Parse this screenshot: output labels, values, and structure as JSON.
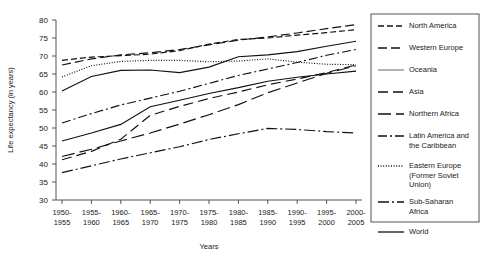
{
  "chart_data": {
    "type": "line",
    "title": "",
    "xlabel": "Years",
    "ylabel": "Life expectancy (in years)",
    "ylim": [
      30,
      80
    ],
    "ytick_step": 5,
    "yticks": [
      30,
      35,
      40,
      45,
      50,
      55,
      60,
      65,
      70,
      75,
      80
    ],
    "grid": false,
    "legend_position": "right",
    "categories": [
      "1950-\n1955",
      "1955-\n1960",
      "1960-\n1965",
      "1965-\n1970",
      "1970-\n1975",
      "1975-\n1980",
      "1980-\n1985",
      "1985-\n1990",
      "1990-\n1995",
      "1995-\n2000",
      "2000-\n2005"
    ],
    "categories_flat": [
      "1950-1955",
      "1955-1960",
      "1960-1965",
      "1965-1970",
      "1970-1975",
      "1975-1980",
      "1980-1985",
      "1985-1990",
      "1990-1995",
      "1995-2000",
      "2000-2005"
    ],
    "series": [
      {
        "name": "North America",
        "style": "dotted-dash",
        "dasharray": "6,3",
        "color": "#111111",
        "values": [
          68.8,
          69.7,
          70.1,
          70.5,
          71.5,
          73.3,
          74.6,
          75.0,
          75.8,
          76.5,
          77.3
        ]
      },
      {
        "name": "Western Europe",
        "style": "dashed-long",
        "dasharray": "9,4",
        "color": "#111111",
        "values": [
          67.5,
          69.2,
          70.3,
          70.9,
          71.8,
          73.1,
          74.4,
          75.3,
          76.4,
          77.6,
          78.7
        ]
      },
      {
        "name": "Oceania",
        "style": "solid-gray",
        "dasharray": "none",
        "color": "#8a8a8a",
        "values": [
          60.3,
          64.3,
          66.0,
          66.1,
          65.4,
          66.9,
          69.8,
          70.3,
          71.2,
          72.7,
          74.1
        ]
      },
      {
        "name": "Asia",
        "style": "dashed-medium",
        "dasharray": "10,5",
        "color": "#111111",
        "values": [
          41.2,
          43.5,
          46.9,
          53.5,
          56.0,
          58.2,
          60.0,
          62.0,
          63.6,
          65.4,
          67.5
        ]
      },
      {
        "name": "Northern Africa",
        "style": "dashed-thick",
        "dasharray": "13,5",
        "color": "#111111",
        "values": [
          42.1,
          44.1,
          46.4,
          48.6,
          51.1,
          53.7,
          56.5,
          59.8,
          62.5,
          65.2,
          67.3
        ]
      },
      {
        "name": "Latin America and the Caribbean",
        "style": "dash-dot",
        "dasharray": "9,3,2,3",
        "color": "#111111",
        "values": [
          51.4,
          54.0,
          56.4,
          58.3,
          60.2,
          62.4,
          64.6,
          66.4,
          68.2,
          70.2,
          71.8
        ]
      },
      {
        "name": "Eastern Europe (Former Soviet Union)",
        "style": "fine-dotted",
        "dasharray": "1,1.6",
        "color": "#111111",
        "values": [
          64.2,
          67.3,
          68.5,
          68.8,
          68.8,
          68.4,
          68.6,
          69.2,
          68.3,
          67.7,
          67.6
        ]
      },
      {
        "name": "Sub-Saharan Africa",
        "style": "long-dash-dot",
        "dasharray": "11,3,2,3",
        "color": "#111111",
        "values": [
          37.6,
          39.5,
          41.4,
          43.1,
          44.8,
          46.8,
          48.4,
          49.9,
          49.6,
          49.0,
          48.6
        ]
      },
      {
        "name": "World",
        "style": "solid",
        "dasharray": "none",
        "color": "#111111",
        "values": [
          46.4,
          48.6,
          51.0,
          55.9,
          57.7,
          59.6,
          61.2,
          63.0,
          64.1,
          65.0,
          65.8
        ]
      }
    ]
  },
  "legend": {
    "entries": [
      {
        "label": "North America",
        "label2": ""
      },
      {
        "label": "Western Europe",
        "label2": ""
      },
      {
        "label": "Oceania",
        "label2": ""
      },
      {
        "label": "Asia",
        "label2": ""
      },
      {
        "label": "Northern  Africa",
        "label2": ""
      },
      {
        "label": "Latin America and",
        "label2": "the Caribbean"
      },
      {
        "label": "Eastern Europe",
        "label2": "(Former Soviet",
        "label3": "Union)"
      },
      {
        "label": "Sub-Saharan",
        "label2": "Africa"
      },
      {
        "label": "World",
        "label2": ""
      }
    ]
  }
}
